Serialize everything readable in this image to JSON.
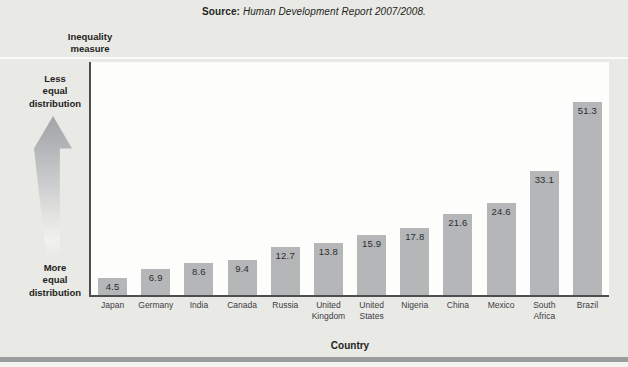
{
  "source": {
    "label": "Source:",
    "text": " Human Development Report 2007/2008."
  },
  "axis_labels": {
    "y_title": "Inequality\nmeasure",
    "top": "Less\nequal\ndistribution",
    "bottom": "More\nequal\ndistribution",
    "x_title": "Country"
  },
  "chart_data": {
    "type": "bar",
    "categories": [
      "Japan",
      "Germany",
      "India",
      "Canada",
      "Russia",
      "United Kingdom",
      "United States",
      "Nigeria",
      "China",
      "Mexico",
      "South Africa",
      "Brazil"
    ],
    "labels_display": [
      "Japan",
      "Germany",
      "India",
      "Canada",
      "Russia",
      "United\nKingdom",
      "United\nStates",
      "Nigeria",
      "China",
      "Mexico",
      "South\nAfrica",
      "Brazil"
    ],
    "values": [
      4.5,
      6.9,
      8.6,
      9.4,
      12.7,
      13.8,
      15.9,
      17.8,
      21.6,
      24.6,
      33.1,
      51.3
    ],
    "title": "",
    "xlabel": "Country",
    "ylabel": "Inequality measure",
    "ylim": [
      0,
      62
    ],
    "grid": false,
    "legend": "none",
    "value_labels": "inside-top",
    "bar_color": "#b4b6b8",
    "axis_color": "#4d4e50"
  },
  "colors": {
    "page_background": "#e9e9e6",
    "plot_background": "#fdfdfc",
    "bar": "#b4b6b8",
    "axis": "#4d4e50",
    "text_dark": "#231f20",
    "bottom_rule": "#9b9d9d",
    "divider_line": "#fbfbf9"
  }
}
